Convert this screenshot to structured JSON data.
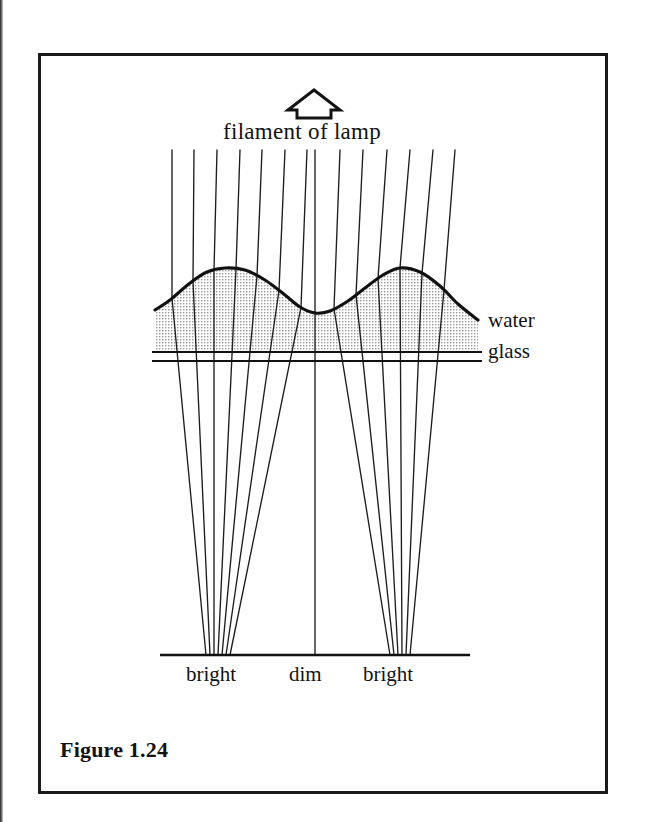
{
  "figure": {
    "caption": "Figure 1.24",
    "domain_kind": "optics-ray-diagram",
    "border_color": "#1b1b1b",
    "ink_color": "#121212",
    "background_color": "#ffffff"
  },
  "labels": {
    "filament": "filament of lamp",
    "water": "water",
    "glass": "glass",
    "bright_left": "bright",
    "dim": "dim",
    "bright_right": "bright"
  },
  "icons": {
    "filament_arrow": "up-arrow-icon"
  },
  "chart_data": {
    "type": "line",
    "title": "Figure 1.24",
    "xlabel": "",
    "ylabel": "",
    "xlim": [
      150,
      480
    ],
    "ylim": [
      660,
      150
    ],
    "grid": false,
    "legend": false,
    "annotations": [
      {
        "text": "filament of lamp",
        "x": 320,
        "y": 130
      },
      {
        "text": "water",
        "x": 488,
        "y": 318
      },
      {
        "text": "glass",
        "x": 488,
        "y": 350
      },
      {
        "text": "bright",
        "x": 215,
        "y": 675
      },
      {
        "text": "dim",
        "x": 315,
        "y": 675
      },
      {
        "text": "bright",
        "x": 400,
        "y": 675
      }
    ],
    "series": [
      {
        "name": "water-surface",
        "type": "line",
        "x": [
          155,
          170,
          190,
          207,
          225,
          245,
          265,
          285,
          300,
          315,
          330,
          348,
          365,
          383,
          400,
          420,
          440,
          458,
          478
        ],
        "y": [
          310,
          300,
          283,
          272,
          268,
          270,
          280,
          295,
          307,
          313,
          311,
          301,
          288,
          275,
          268,
          272,
          286,
          304,
          320
        ]
      },
      {
        "name": "glass-top",
        "type": "line",
        "x": [
          152,
          482
        ],
        "y": [
          352,
          352
        ]
      },
      {
        "name": "glass-bottom",
        "type": "line",
        "x": [
          152,
          482
        ],
        "y": [
          361,
          361
        ]
      },
      {
        "name": "screen",
        "type": "line",
        "x": [
          160,
          470
        ],
        "y": [
          655,
          655
        ]
      }
    ],
    "rays": {
      "count": 13,
      "start_y": 150,
      "end_y": 655,
      "start_x": [
        172,
        194,
        217,
        240,
        262,
        285,
        307,
        340,
        363,
        387,
        410,
        433,
        455
      ],
      "surface_x": [
        172,
        193,
        214,
        236,
        257,
        279,
        301,
        334,
        356,
        378,
        400,
        422,
        444
      ],
      "end_x": [
        206,
        210,
        214,
        218,
        222,
        226,
        230,
        390,
        394,
        398,
        402,
        406,
        410
      ]
    },
    "focus_points": [
      {
        "label": "bright",
        "x": 215,
        "y": 655
      },
      {
        "label": "dim",
        "x": 315,
        "y": 655
      },
      {
        "label": "bright",
        "x": 400,
        "y": 655
      }
    ]
  }
}
